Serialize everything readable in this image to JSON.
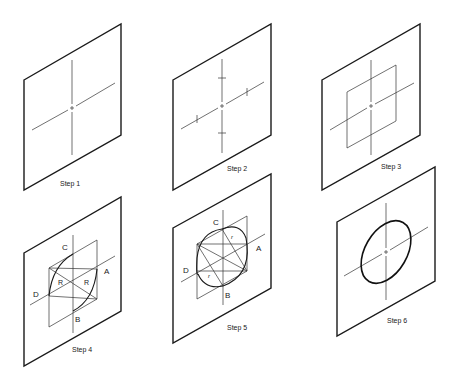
{
  "diagram": {
    "steps": [
      {
        "label": "Step 1"
      },
      {
        "label": "Step 2"
      },
      {
        "label": "Step 3"
      },
      {
        "label": "Step 4",
        "points": {
          "a": "A",
          "b": "B",
          "c": "C",
          "d": "D"
        },
        "radius_labels": [
          "R",
          "R"
        ]
      },
      {
        "label": "Step 5",
        "points": {
          "a": "A",
          "b": "B",
          "c": "C",
          "d": "D"
        },
        "radius_labels": [
          "r",
          "r"
        ]
      },
      {
        "label": "Step 6"
      }
    ],
    "colors": {
      "line": "#1a1a1a",
      "background": "#ffffff"
    }
  }
}
